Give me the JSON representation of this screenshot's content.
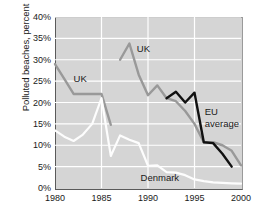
{
  "chart_data": {
    "type": "line",
    "title": "",
    "xlabel": "",
    "ylabel": "Polluted beaches, percent",
    "xlim": [
      1980,
      2000
    ],
    "ylim": [
      0,
      40
    ],
    "xticks": [
      1980,
      1985,
      1990,
      1995,
      2000
    ],
    "yticks": [
      "0%",
      "5%",
      "10%",
      "15%",
      "20%",
      "25%",
      "30%",
      "35%",
      "40%"
    ],
    "ytick_values": [
      0,
      5,
      10,
      15,
      20,
      25,
      30,
      35,
      40
    ],
    "grid": "horizontal and vertical white gridlines on gray panel",
    "legend": "inline labels on plot",
    "series": [
      {
        "name": "UK",
        "color": "#999999",
        "segments": [
          {
            "x": [
              1980,
              1981,
              1982,
              1983,
              1984,
              1985,
              1986
            ],
            "y": [
              29.0,
              25.5,
              22.0,
              22.0,
              22.0,
              22.0,
              14.8
            ]
          },
          {
            "x": [
              1987,
              1988,
              1989,
              1990,
              1991,
              1992,
              1993,
              1994,
              1995,
              1996,
              1997,
              1998,
              1999,
              2000
            ],
            "y": [
              30.0,
              33.8,
              26.5,
              21.7,
              24.0,
              21.0,
              20.3,
              18.0,
              15.0,
              10.7,
              10.7,
              10.0,
              8.7,
              5.3
            ]
          }
        ]
      },
      {
        "name": "Denmark",
        "color": "#fdfdfd",
        "segments": [
          {
            "x": [
              1980,
              1981,
              1982,
              1983,
              1984,
              1985,
              1986,
              1987,
              1988,
              1989,
              1990,
              1991,
              1992,
              1993,
              1994,
              1995,
              1996,
              1997,
              1998,
              1999,
              2000
            ],
            "y": [
              13.5,
              12.0,
              11.0,
              12.5,
              15.0,
              21.0,
              7.5,
              12.3,
              11.3,
              10.5,
              5.2,
              5.3,
              3.7,
              3.6,
              3.0,
              2.0,
              1.6,
              1.3,
              1.2,
              1.1,
              1.0
            ]
          }
        ]
      },
      {
        "name": "EU average",
        "color": "#111111",
        "segments": [
          {
            "x": [
              1992,
              1993,
              1994,
              1995,
              1996,
              1997,
              1998,
              1999
            ],
            "y": [
              21.0,
              22.5,
              20.0,
              22.3,
              10.7,
              10.5,
              8.0,
              5.0
            ]
          }
        ]
      }
    ],
    "annotations": [
      {
        "text": "UK",
        "x": 1982.0,
        "y": 25.2,
        "name": "uk-label-left"
      },
      {
        "text": "UK",
        "x": 1988.8,
        "y": 32.3,
        "name": "uk-label-right"
      },
      {
        "text": "EU",
        "x": 1996.1,
        "y": 17.5,
        "name": "eu-label-line1"
      },
      {
        "text": "average",
        "x": 1996.1,
        "y": 14.8,
        "name": "eu-label-line2"
      },
      {
        "text": "Denmark",
        "x": 1989.2,
        "y": 2.0,
        "name": "denmark-label"
      }
    ]
  },
  "axes": {
    "ylabel": "Polluted beaches, percent",
    "ytick_labels": [
      "40%",
      "35%",
      "30%",
      "25%",
      "20%",
      "15%",
      "10%",
      "5%",
      "0%"
    ],
    "xtick_labels": [
      "1980",
      "1985",
      "1990",
      "1995",
      "2000"
    ]
  },
  "colors": {
    "panel_background": "#d5d5d5",
    "gridline": "#ffffff",
    "axis": "#5a5a5a",
    "uk_series": "#999999",
    "denmark_series": "#fdfdfd",
    "eu_series": "#111111",
    "text": "#1a1a1a"
  }
}
